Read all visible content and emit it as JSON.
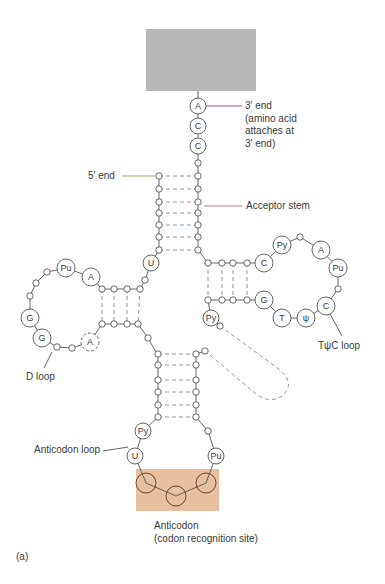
{
  "figure": {
    "panel_label": "(a)"
  },
  "colors": {
    "amino_acid_box": "#b8b8b8",
    "anticodon_box": "#e8c0a0",
    "line": "#555555",
    "bond_dash": "#8a8a8a",
    "text": "#3a3a3a",
    "label_line_3prime": "#8a4a7a",
    "label_line_5prime": "#9a9a5a",
    "label_line_acceptor": "#b07070"
  },
  "labels": {
    "three_prime": {
      "line1": "3′ end",
      "line2": "(amino acid",
      "line3": "attaches at",
      "line4": "3′ end)"
    },
    "five_prime": "5′ end",
    "acceptor_stem": "Acceptor stem",
    "d_loop": "D loop",
    "t_loop": "TψC loop",
    "anticodon_loop": "Anticodon loop",
    "anticodon": {
      "line1": "Anticodon",
      "line2": "(codon recognition site)"
    }
  },
  "nucleotides": {
    "acceptor_end": [
      "A",
      "C",
      "C"
    ],
    "d_loop": [
      "Pu",
      "A",
      "G",
      "G",
      "A"
    ],
    "t_loop": [
      "C",
      "Py",
      "A",
      "Pu",
      "C",
      "ψ",
      "T",
      "G"
    ],
    "junction": [
      "U",
      "Py"
    ],
    "anticodon_loop": [
      "Py",
      "U",
      "Pu"
    ],
    "anticodon_bases": [
      "",
      "",
      ""
    ]
  },
  "stems": {
    "acceptor_pairs": 7,
    "d_stem_pairs": 4,
    "t_stem_pairs": 4,
    "anticodon_stem_pairs": 6
  }
}
